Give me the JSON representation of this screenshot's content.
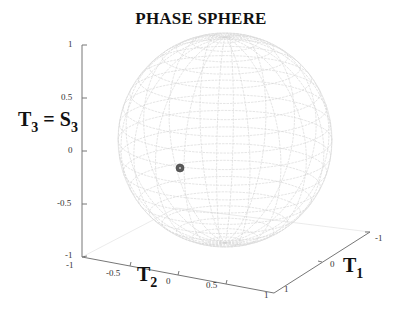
{
  "chart_data": {
    "type": "scatter3d",
    "title": "PHASE SPHERE",
    "xlabel": "T1",
    "ylabel": "T2",
    "zlabel": "T3 = S3",
    "xlabel_main": "T",
    "xlabel_sub": "1",
    "ylabel_main": "T",
    "ylabel_sub": "2",
    "zlabel_lhs_main": "T",
    "zlabel_lhs_sub": "3",
    "zlabel_eq": "=",
    "zlabel_rhs_main": "S",
    "zlabel_rhs_sub": "3",
    "xlim": [
      -1,
      1
    ],
    "ylim": [
      -1,
      1
    ],
    "zlim": [
      -1,
      1
    ],
    "xticks": [
      "-1",
      "0",
      "1"
    ],
    "yticks": [
      "-1",
      "-0.5",
      "0",
      "0.5",
      "1"
    ],
    "zticks": [
      "-1",
      "-0.5",
      "0",
      "0.5",
      "1"
    ],
    "grid": false,
    "surface": {
      "shape": "unit sphere wireframe",
      "segments": 20,
      "color": "#d4d4d4"
    },
    "points": [
      {
        "label": "state",
        "screen_hint": "left of sphere center, slightly below equator",
        "T3": -0.1,
        "color": "#555555"
      }
    ]
  }
}
